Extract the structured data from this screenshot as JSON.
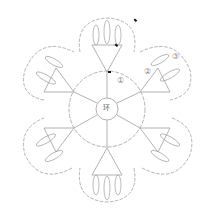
{
  "diagram": {
    "type": "crochet-chart",
    "center_label": "环",
    "round_labels": [
      "①",
      "②",
      "③"
    ],
    "petals": 6,
    "line_color": "#9a9a9a",
    "marker_color": "#111111"
  }
}
